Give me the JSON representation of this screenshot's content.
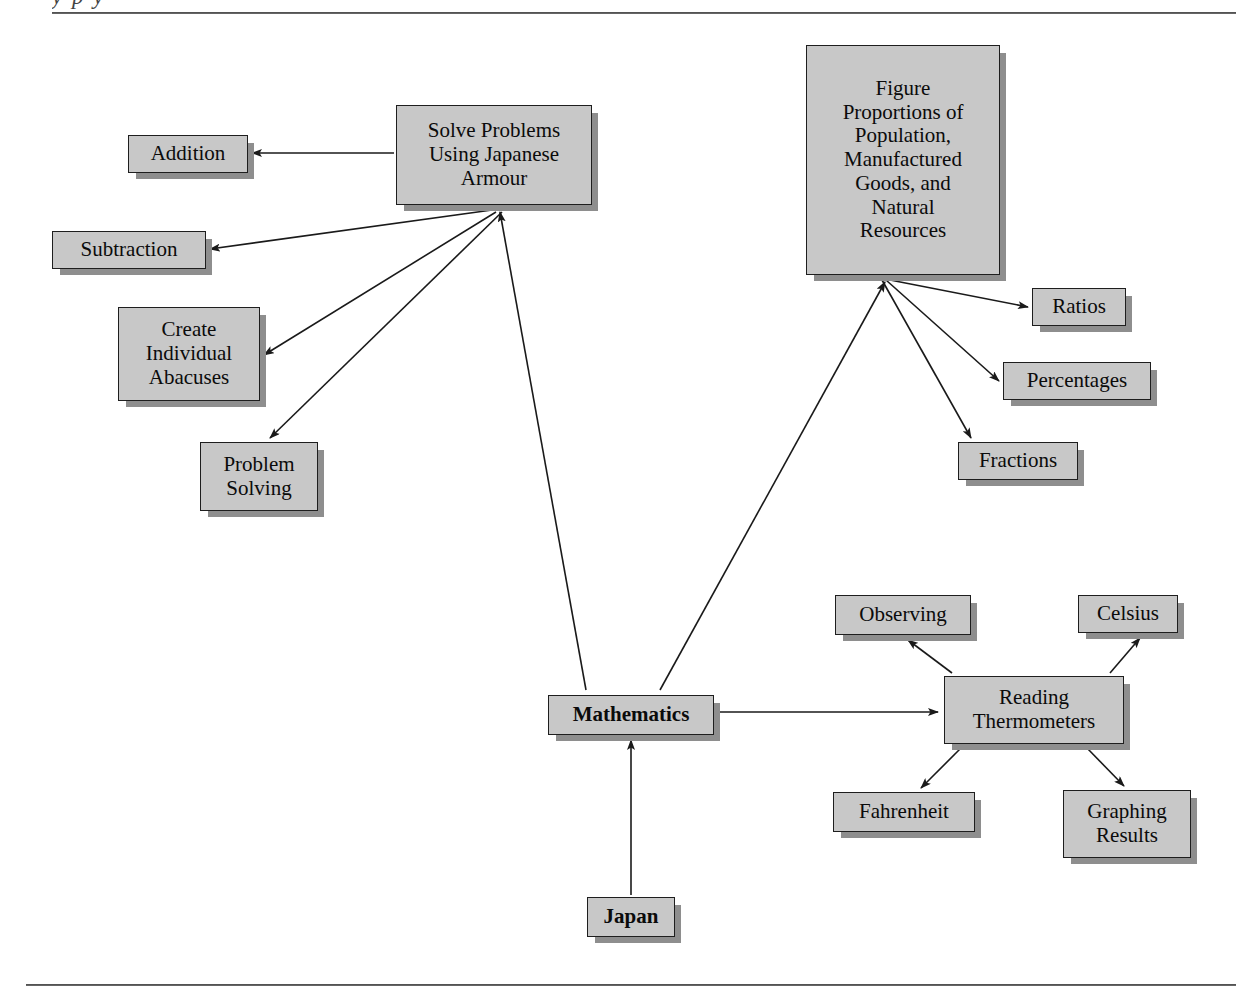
{
  "page": {
    "clipped_running_head": "y p       y",
    "background_color": "#ffffff",
    "node_fill": "#c8c8c8",
    "node_border": "#1e1e1e",
    "shadow_color": "#8e8e8e",
    "rule_color": "#4a4a4a"
  },
  "diagram": {
    "type": "concept-map",
    "root": "Mathematics",
    "nodes": [
      {
        "id": "solve-problems",
        "label": "Solve Problems\nUsing Japanese\nArmour",
        "x": 396,
        "y": 105,
        "w": 196,
        "h": 100,
        "bold": false
      },
      {
        "id": "addition",
        "label": "Addition",
        "x": 128,
        "y": 135,
        "w": 120,
        "h": 38,
        "bold": false
      },
      {
        "id": "subtraction",
        "label": "Subtraction",
        "x": 52,
        "y": 231,
        "w": 154,
        "h": 38,
        "bold": false
      },
      {
        "id": "create-abacuses",
        "label": "Create\nIndividual\nAbacuses",
        "x": 118,
        "y": 307,
        "w": 142,
        "h": 94,
        "bold": false
      },
      {
        "id": "problem-solving",
        "label": "Problem\nSolving",
        "x": 200,
        "y": 442,
        "w": 118,
        "h": 69,
        "bold": false
      },
      {
        "id": "figure-proportions",
        "label": "Figure\nProportions of\nPopulation,\nManufactured\nGoods, and\nNatural\nResources",
        "x": 806,
        "y": 45,
        "w": 194,
        "h": 230,
        "bold": false
      },
      {
        "id": "ratios",
        "label": "Ratios",
        "x": 1032,
        "y": 288,
        "w": 94,
        "h": 38,
        "bold": false
      },
      {
        "id": "percentages",
        "label": "Percentages",
        "x": 1003,
        "y": 362,
        "w": 148,
        "h": 38,
        "bold": false
      },
      {
        "id": "fractions",
        "label": "Fractions",
        "x": 958,
        "y": 442,
        "w": 120,
        "h": 38,
        "bold": false
      },
      {
        "id": "mathematics",
        "label": "Mathematics",
        "x": 548,
        "y": 695,
        "w": 166,
        "h": 40,
        "bold": true
      },
      {
        "id": "japan",
        "label": "Japan",
        "x": 587,
        "y": 897,
        "w": 88,
        "h": 40,
        "bold": true
      },
      {
        "id": "reading-thermometers",
        "label": "Reading\nThermometers",
        "x": 944,
        "y": 676,
        "w": 180,
        "h": 68,
        "bold": false
      },
      {
        "id": "observing",
        "label": "Observing",
        "x": 835,
        "y": 595,
        "w": 136,
        "h": 40,
        "bold": false
      },
      {
        "id": "celsius",
        "label": "Celsius",
        "x": 1078,
        "y": 595,
        "w": 100,
        "h": 38,
        "bold": false
      },
      {
        "id": "fahrenheit",
        "label": "Fahrenheit",
        "x": 833,
        "y": 792,
        "w": 142,
        "h": 40,
        "bold": false
      },
      {
        "id": "graphing-results",
        "label": "Graphing\nResults",
        "x": 1063,
        "y": 790,
        "w": 128,
        "h": 68,
        "bold": false
      }
    ],
    "edges": [
      {
        "from": "mathematics",
        "to": "solve-problems",
        "x1": 586,
        "y1": 690,
        "x2": 500,
        "y2": 212
      },
      {
        "from": "mathematics",
        "to": "figure-proportions",
        "x1": 660,
        "y1": 690,
        "x2": 885,
        "y2": 282
      },
      {
        "from": "mathematics",
        "to": "reading-thermometers",
        "x1": 718,
        "y1": 712,
        "x2": 938,
        "y2": 712
      },
      {
        "from": "japan",
        "to": "mathematics",
        "x1": 631,
        "y1": 895,
        "x2": 631,
        "y2": 740
      },
      {
        "from": "solve-problems",
        "to": "addition",
        "x1": 394,
        "y1": 153,
        "x2": 252,
        "y2": 153
      },
      {
        "from": "solve-problems",
        "to": "subtraction",
        "x1": 492,
        "y1": 210,
        "x2": 210,
        "y2": 249
      },
      {
        "from": "solve-problems",
        "to": "create-abacuses",
        "x1": 496,
        "y1": 212,
        "x2": 264,
        "y2": 355
      },
      {
        "from": "solve-problems",
        "to": "problem-solving",
        "x1": 502,
        "y1": 212,
        "x2": 270,
        "y2": 438
      },
      {
        "from": "figure-proportions",
        "to": "ratios",
        "x1": 890,
        "y1": 280,
        "x2": 1028,
        "y2": 307
      },
      {
        "from": "figure-proportions",
        "to": "percentages",
        "x1": 886,
        "y1": 280,
        "x2": 999,
        "y2": 381
      },
      {
        "from": "figure-proportions",
        "to": "fractions",
        "x1": 882,
        "y1": 280,
        "x2": 971,
        "y2": 438
      },
      {
        "from": "reading-thermometers",
        "to": "observing",
        "x1": 952,
        "y1": 673,
        "x2": 908,
        "y2": 640
      },
      {
        "from": "reading-thermometers",
        "to": "celsius",
        "x1": 1110,
        "y1": 673,
        "x2": 1140,
        "y2": 638
      },
      {
        "from": "reading-thermometers",
        "to": "fahrenheit",
        "x1": 962,
        "y1": 747,
        "x2": 921,
        "y2": 788
      },
      {
        "from": "reading-thermometers",
        "to": "graphing-results",
        "x1": 1086,
        "y1": 747,
        "x2": 1124,
        "y2": 786
      }
    ]
  }
}
